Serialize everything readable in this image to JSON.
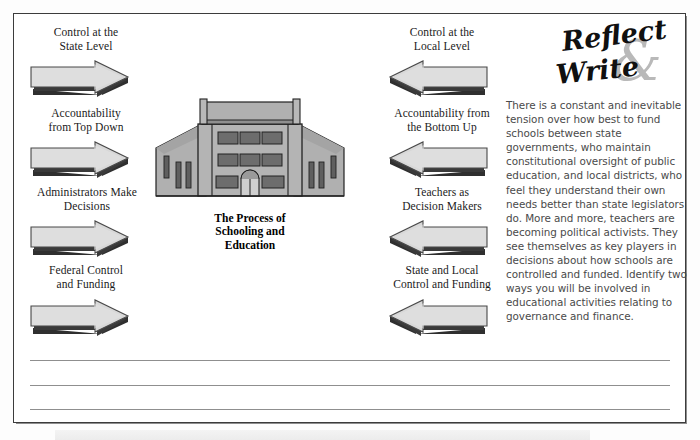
{
  "figure": {
    "center_caption": "The Process of\nSchooling and\nEducation"
  },
  "left_column": {
    "heading": "Control at the\nState Level",
    "items": [
      {
        "label": "Control at the\nState Level",
        "arrow": "arrow-right-icon"
      },
      {
        "label": "Accountability\nfrom Top Down",
        "arrow": "arrow-right-icon"
      },
      {
        "label": "Administrators Make\nDecisions",
        "arrow": "arrow-right-icon"
      },
      {
        "label": "Federal Control\nand Funding",
        "arrow": "arrow-right-icon"
      }
    ]
  },
  "right_column": {
    "heading": "Control at the\nLocal Level",
    "items": [
      {
        "label": "Control at the\nLocal Level",
        "arrow": "arrow-left-icon"
      },
      {
        "label": "Accountability from\nthe Bottom Up",
        "arrow": "arrow-left-icon"
      },
      {
        "label": "Teachers as\nDecision Makers",
        "arrow": "arrow-left-icon"
      },
      {
        "label": "State and Local\nControl and Funding",
        "arrow": "arrow-left-icon"
      }
    ]
  },
  "reflect_write": {
    "word1": "Reflect",
    "ampersand": "&",
    "word2": "Write",
    "body": "There is a constant and inevitable tension over how best to fund schools between state governments, who maintain constitutional oversight of public education, and local districts, who feel they understand their own needs better than state legislators do. More and more, teachers are becoming political activists. They see themselves as key players in decisions about how schools are controlled and funded. Identify two ways you will be involved in educational activities relating to governance and finance.",
    "body_lines": [
      "There is a constant and inevi-",
      "table tension over how best",
      "to fund schools between state",
      "governments, who maintain",
      "constitutional oversight of public",
      "education, and local districts,",
      "who feel they understand their",
      "own needs better than state",
      "legislators do. More and more,",
      "teachers are becoming political",
      "activists. They see themselves as",
      "key players in decisions about",
      "how schools are controlled and",
      "funded. Identify two ways you",
      "will be involved in educational",
      "activities relating to governance",
      "and finance."
    ]
  },
  "writing_lines": {
    "count": 3
  },
  "bottom_strip": {
    "text": ""
  },
  "colors": {
    "border": "#3c3c3c",
    "arrow_face": "#d8d8d8",
    "arrow_shadow": "#3a3a3a",
    "building_wall": "#b0b0b0",
    "building_window": "#6d6d6d",
    "rule_line": "#8f8f8f",
    "body_text": "#4a4a4a",
    "amp_gray": "#b9b9b9"
  }
}
